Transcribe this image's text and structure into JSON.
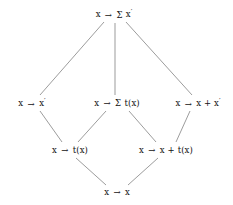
{
  "diagram": {
    "type": "hasse-lattice",
    "title": "",
    "background_color": "#ffffff",
    "edge_color": "#8a8a8a",
    "text_color": "#121212",
    "arrow_glyph": "→",
    "sigma_glyph": "Σ",
    "prime_glyph": "′",
    "nodes": [
      {
        "id": "top",
        "label": "x → Σ x′",
        "level": 0,
        "x": 114,
        "y": 14
      },
      {
        "id": "mid-left",
        "label": "x → x′",
        "level": 1,
        "x": 32,
        "y": 103
      },
      {
        "id": "mid-center",
        "label": "x → Σ t(x)",
        "level": 1,
        "x": 117,
        "y": 103
      },
      {
        "id": "mid-right",
        "label": "x → x + x′",
        "level": 1,
        "x": 198,
        "y": 103
      },
      {
        "id": "low-left",
        "label": "x → t(x)",
        "level": 2,
        "x": 70,
        "y": 150
      },
      {
        "id": "low-right",
        "label": "x → x + t(x)",
        "level": 2,
        "x": 166,
        "y": 150
      },
      {
        "id": "bottom",
        "label": "x → x",
        "level": 3,
        "x": 117,
        "y": 192
      }
    ],
    "edges": [
      {
        "from": "top",
        "to": "mid-left",
        "x1": 104,
        "y1": 22,
        "x2": 40,
        "y2": 95
      },
      {
        "from": "top",
        "to": "mid-center",
        "x1": 115,
        "y1": 23,
        "x2": 115,
        "y2": 95
      },
      {
        "from": "top",
        "to": "mid-right",
        "x1": 126,
        "y1": 22,
        "x2": 192,
        "y2": 95
      },
      {
        "from": "mid-left",
        "to": "low-left",
        "x1": 40,
        "y1": 111,
        "x2": 62,
        "y2": 142
      },
      {
        "from": "mid-center",
        "to": "low-left",
        "x1": 106,
        "y1": 111,
        "x2": 78,
        "y2": 142
      },
      {
        "from": "mid-center",
        "to": "low-right",
        "x1": 129,
        "y1": 111,
        "x2": 156,
        "y2": 142
      },
      {
        "from": "mid-right",
        "to": "low-right",
        "x1": 190,
        "y1": 111,
        "x2": 176,
        "y2": 142
      },
      {
        "from": "low-left",
        "to": "bottom",
        "x1": 76,
        "y1": 158,
        "x2": 106,
        "y2": 185
      },
      {
        "from": "low-right",
        "to": "bottom",
        "x1": 158,
        "y1": 158,
        "x2": 128,
        "y2": 185
      }
    ]
  }
}
